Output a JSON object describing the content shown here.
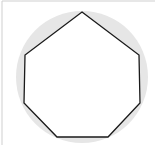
{
  "figure": {
    "shape": "heptagon",
    "colors": {
      "background": "#ffffff",
      "circle_fill": "#e6e6e6",
      "polygon_fill": "#ffffff",
      "polygon_stroke": "#1a1a1a",
      "frame_border": "#cfcfcf"
    },
    "circle": {
      "cx": 82,
      "cy": 77,
      "r": 66
    },
    "polygon_points": "82,12 139,55 140,103 108,137 57,137 24,103 25,55"
  }
}
